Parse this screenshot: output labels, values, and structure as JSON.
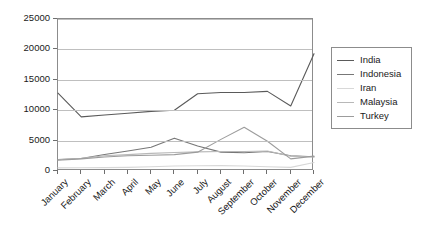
{
  "chart_data": {
    "type": "line",
    "title": "",
    "xlabel": "",
    "ylabel": "",
    "grid": true,
    "legend_position": "right",
    "ylim": [
      0,
      25000
    ],
    "yticks": [
      0,
      5000,
      10000,
      15000,
      20000,
      25000
    ],
    "ytick_labels": [
      "0",
      "5000",
      "10000",
      "15000",
      "20000",
      "25000"
    ],
    "categories": [
      "January",
      "February",
      "March",
      "April",
      "May",
      "June",
      "July",
      "August",
      "September",
      "October",
      "November",
      "December"
    ],
    "series": [
      {
        "name": "India",
        "color": "#5a5a5a",
        "values": [
          12800,
          8900,
          9200,
          9500,
          9800,
          10000,
          12700,
          12900,
          12900,
          13100,
          10700,
          19300
        ]
      },
      {
        "name": "Indonesia",
        "color": "#777777",
        "values": [
          1900,
          2050,
          2700,
          3300,
          3900,
          5400,
          4100,
          3100,
          3000,
          3200,
          2500,
          2350
        ]
      },
      {
        "name": "Iran",
        "color": "#d8d8d8",
        "values": [
          520,
          540,
          560,
          600,
          700,
          820,
          860,
          880,
          820,
          700,
          600,
          1400
        ]
      },
      {
        "name": "Malaysia",
        "color": "#b8b8b8",
        "values": [
          1850,
          2100,
          2500,
          2700,
          2900,
          3050,
          3150,
          3200,
          3200,
          3300,
          2450,
          2300
        ]
      },
      {
        "name": "Turkey",
        "color": "#9c9c9c",
        "values": [
          1780,
          2000,
          2300,
          2500,
          2600,
          2700,
          3100,
          5200,
          7200,
          4900,
          2000,
          2450
        ]
      }
    ]
  }
}
